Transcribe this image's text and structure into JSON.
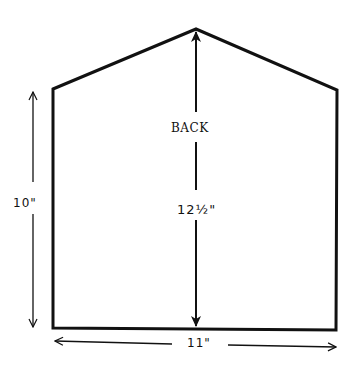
{
  "diagram": {
    "panel_label": "BACK",
    "dimensions": {
      "center_height": "12½\"",
      "side_height": "10\"",
      "width": "11\""
    },
    "colors": {
      "line": "#111111",
      "background": "#ffffff"
    }
  }
}
